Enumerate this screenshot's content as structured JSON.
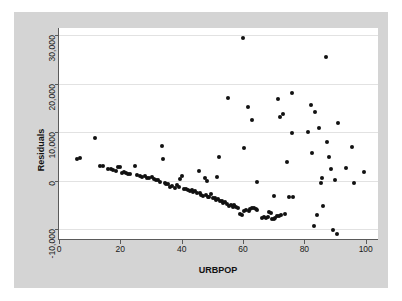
{
  "chart_data": {
    "type": "scatter",
    "title": "",
    "xlabel": "URBPOP",
    "ylabel": "Residuals",
    "xlim": [
      0,
      104
    ],
    "ylim": [
      -12000,
      31500
    ],
    "xticks": [
      0,
      20,
      40,
      60,
      80,
      100
    ],
    "xtick_labels": [
      "0",
      "20",
      "40",
      "60",
      "80",
      "100"
    ],
    "yticks": [
      -10000,
      0,
      10000,
      20000,
      30000
    ],
    "ytick_labels": [
      "-10,000",
      "0",
      "10,000",
      "20,000",
      "30,000"
    ],
    "grid": "horizontal",
    "legend": "none",
    "marker_color": "#111111",
    "plot_background": "#ffffff",
    "figure_background": "#d4d4d4",
    "gridline_color": "#e2e2e2",
    "axis_color": "#5a5a5a",
    "points": [
      [
        6.0,
        4500
      ],
      [
        6.8,
        4700
      ],
      [
        11.8,
        8900
      ],
      [
        13.5,
        3100
      ],
      [
        14.3,
        3000
      ],
      [
        16.0,
        2400
      ],
      [
        16.8,
        2450
      ],
      [
        17.5,
        2300
      ],
      [
        18.5,
        2100
      ],
      [
        19.2,
        2900
      ],
      [
        19.8,
        2850
      ],
      [
        20.5,
        1700
      ],
      [
        21.2,
        1900
      ],
      [
        21.8,
        1600
      ],
      [
        22.5,
        1500
      ],
      [
        23.3,
        1350
      ],
      [
        24.8,
        3100
      ],
      [
        25.5,
        1100
      ],
      [
        26.5,
        900
      ],
      [
        27.2,
        800
      ],
      [
        27.9,
        1000
      ],
      [
        28.6,
        600
      ],
      [
        29.3,
        500
      ],
      [
        30.2,
        700
      ],
      [
        30.9,
        400
      ],
      [
        31.5,
        250
      ],
      [
        32.3,
        100
      ],
      [
        33.0,
        -200
      ],
      [
        33.6,
        7100
      ],
      [
        33.9,
        4400
      ],
      [
        34.4,
        -400
      ],
      [
        35.0,
        -700
      ],
      [
        35.6,
        -600
      ],
      [
        36.3,
        -1200
      ],
      [
        37.0,
        -1100
      ],
      [
        37.8,
        -1500
      ],
      [
        38.4,
        -900
      ],
      [
        39.0,
        -1300
      ],
      [
        39.6,
        400
      ],
      [
        40.2,
        1000
      ],
      [
        40.8,
        -1700
      ],
      [
        41.4,
        -1600
      ],
      [
        42.0,
        -1900
      ],
      [
        42.6,
        -2100
      ],
      [
        43.2,
        -2000
      ],
      [
        43.8,
        -2400
      ],
      [
        44.4,
        -2200
      ],
      [
        45.0,
        -2600
      ],
      [
        45.5,
        2100
      ],
      [
        45.9,
        -2500
      ],
      [
        46.4,
        -2900
      ],
      [
        47.0,
        -3100
      ],
      [
        47.5,
        500
      ],
      [
        48.2,
        -100
      ],
      [
        47.9,
        -3000
      ],
      [
        48.5,
        -3400
      ],
      [
        49.0,
        -3300
      ],
      [
        49.6,
        -2700
      ],
      [
        50.1,
        -3600
      ],
      [
        50.7,
        -3500
      ],
      [
        51.2,
        -3900
      ],
      [
        51.8,
        -3800
      ],
      [
        51.5,
        800
      ],
      [
        52.3,
        5000
      ],
      [
        52.4,
        -4200
      ],
      [
        53.0,
        -4100
      ],
      [
        53.6,
        -4600
      ],
      [
        54.2,
        -4400
      ],
      [
        54.8,
        -4800
      ],
      [
        55.1,
        17100
      ],
      [
        55.4,
        -5100
      ],
      [
        56.0,
        -4900
      ],
      [
        56.6,
        -5300
      ],
      [
        57.2,
        -5000
      ],
      [
        57.8,
        -5500
      ],
      [
        58.3,
        -5700
      ],
      [
        57.0,
        -5200
      ],
      [
        58.9,
        -6900
      ],
      [
        59.5,
        -7000
      ],
      [
        59.9,
        29500
      ],
      [
        60.3,
        6800
      ],
      [
        60.4,
        -6200
      ],
      [
        61.0,
        -6100
      ],
      [
        61.6,
        15200
      ],
      [
        61.8,
        -6300
      ],
      [
        62.4,
        -5800
      ],
      [
        62.9,
        12600
      ],
      [
        63.0,
        -5600
      ],
      [
        63.5,
        -5700
      ],
      [
        64.4,
        -300
      ],
      [
        64.1,
        -5900
      ],
      [
        64.7,
        -6000
      ],
      [
        66.3,
        -7600
      ],
      [
        66.9,
        -7400
      ],
      [
        67.4,
        -7700
      ],
      [
        68.0,
        -7500
      ],
      [
        68.4,
        -6400
      ],
      [
        69.0,
        -6700
      ],
      [
        69.6,
        -7900
      ],
      [
        70.1,
        -7800
      ],
      [
        70.5,
        -7600
      ],
      [
        71.0,
        -7300
      ],
      [
        70.2,
        -3200
      ],
      [
        71.5,
        16800
      ],
      [
        71.8,
        -7200
      ],
      [
        72.4,
        -7100
      ],
      [
        72.0,
        13200
      ],
      [
        73.0,
        13700
      ],
      [
        73.6,
        -6900
      ],
      [
        74.2,
        3900
      ],
      [
        75.0,
        -3400
      ],
      [
        75.8,
        18200
      ],
      [
        76.4,
        -3300
      ],
      [
        76.0,
        9900
      ],
      [
        81.2,
        10000
      ],
      [
        82.0,
        15600
      ],
      [
        82.5,
        5700
      ],
      [
        83.0,
        -9300
      ],
      [
        83.6,
        14100
      ],
      [
        84.2,
        -7000
      ],
      [
        84.8,
        10900
      ],
      [
        85.3,
        -500
      ],
      [
        85.6,
        500
      ],
      [
        86.0,
        -5100
      ],
      [
        87.0,
        25500
      ],
      [
        87.5,
        7900
      ],
      [
        88.0,
        5000
      ],
      [
        88.6,
        2500
      ],
      [
        89.4,
        -10200
      ],
      [
        90.5,
        -11000
      ],
      [
        90.0,
        200
      ],
      [
        91.0,
        12000
      ],
      [
        93.5,
        2600
      ],
      [
        95.5,
        7000
      ],
      [
        96.2,
        -400
      ],
      [
        99.5,
        1800
      ]
    ]
  }
}
